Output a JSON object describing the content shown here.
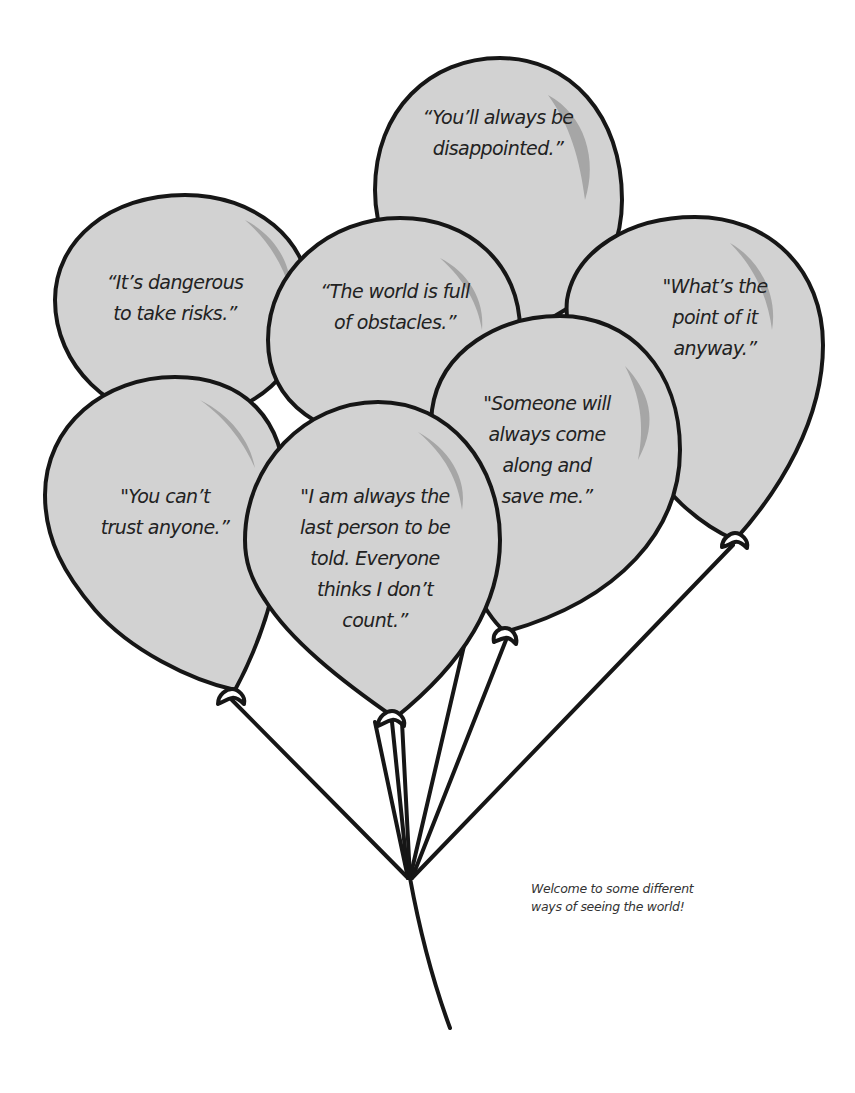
{
  "illustration": {
    "subject": "bunch of balloons with negative beliefs",
    "colors": {
      "balloon_fill": "#d2d2d2",
      "balloon_outline": "#161616",
      "highlight": "#a6a6a6",
      "background": "#ffffff"
    },
    "balloons": [
      {
        "id": "top-center",
        "text": "“You’ll always be\ndisappointed.”"
      },
      {
        "id": "upper-left",
        "text": "“It’s dangerous\nto take risks.”"
      },
      {
        "id": "middle-center",
        "text": "“The world is full\nof obstacles.”"
      },
      {
        "id": "upper-right",
        "text": "\"What’s the\npoint of it\nanyway.”"
      },
      {
        "id": "middle-right",
        "text": "\"Someone will\nalways come\nalong and\nsave me.”"
      },
      {
        "id": "lower-left",
        "text": "\"You can’t\ntrust anyone.”"
      },
      {
        "id": "front-center",
        "text": "\"I am always the\nlast person to be\ntold. Everyone\nthinks I don’t\ncount.”"
      }
    ],
    "caption": "Welcome to some different\nways of seeing the world!"
  }
}
